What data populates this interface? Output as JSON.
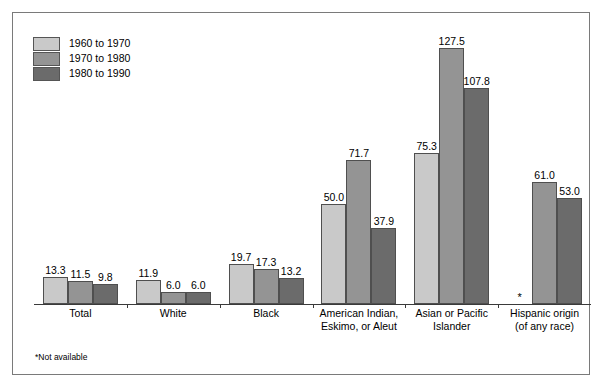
{
  "chart_data": {
    "type": "bar",
    "title": "",
    "subtitle": "",
    "xlabel": "",
    "ylabel": "",
    "ylim": [
      0,
      135
    ],
    "grid": false,
    "legend_position": "top-left",
    "categories": [
      "Total",
      "White",
      "Black",
      "American Indian,\nEskimo, or Aleut",
      "Asian or Pacific\nIslander",
      "Hispanic origin\n(of any race)"
    ],
    "category_lines": [
      [
        "Total"
      ],
      [
        "White"
      ],
      [
        "Black"
      ],
      [
        "American Indian,",
        "Eskimo, or Aleut"
      ],
      [
        "Asian or Pacific",
        "Islander"
      ],
      [
        "Hispanic origin",
        "(of any race)"
      ]
    ],
    "series": [
      {
        "name": "1960 to 1970",
        "color": "#c9c9c9",
        "values": [
          13.3,
          11.9,
          19.7,
          50.0,
          75.3,
          null
        ],
        "labels": [
          "13.3",
          "11.9",
          "19.7",
          "50.0",
          "75.3",
          "*"
        ]
      },
      {
        "name": "1970 to 1980",
        "color": "#949494",
        "values": [
          11.5,
          6.0,
          17.3,
          71.7,
          127.5,
          61.0
        ],
        "labels": [
          "11.5",
          "6.0",
          "17.3",
          "71.7",
          "127.5",
          "61.0"
        ]
      },
      {
        "name": "1980 to 1990",
        "color": "#6b6b6b",
        "values": [
          9.8,
          6.0,
          13.2,
          37.9,
          107.8,
          53.0
        ],
        "labels": [
          "9.8",
          "6.0",
          "13.2",
          "37.9",
          "107.8",
          "53.0"
        ]
      }
    ],
    "footnote": "*Not available",
    "na_marker": "*"
  },
  "legend": {
    "items": [
      {
        "label": "1960 to 1970",
        "color": "#c9c9c9"
      },
      {
        "label": "1970 to 1980",
        "color": "#949494"
      },
      {
        "label": "1980 to 1990",
        "color": "#6b6b6b"
      }
    ]
  },
  "footnote": {
    "text": "*Not available"
  }
}
